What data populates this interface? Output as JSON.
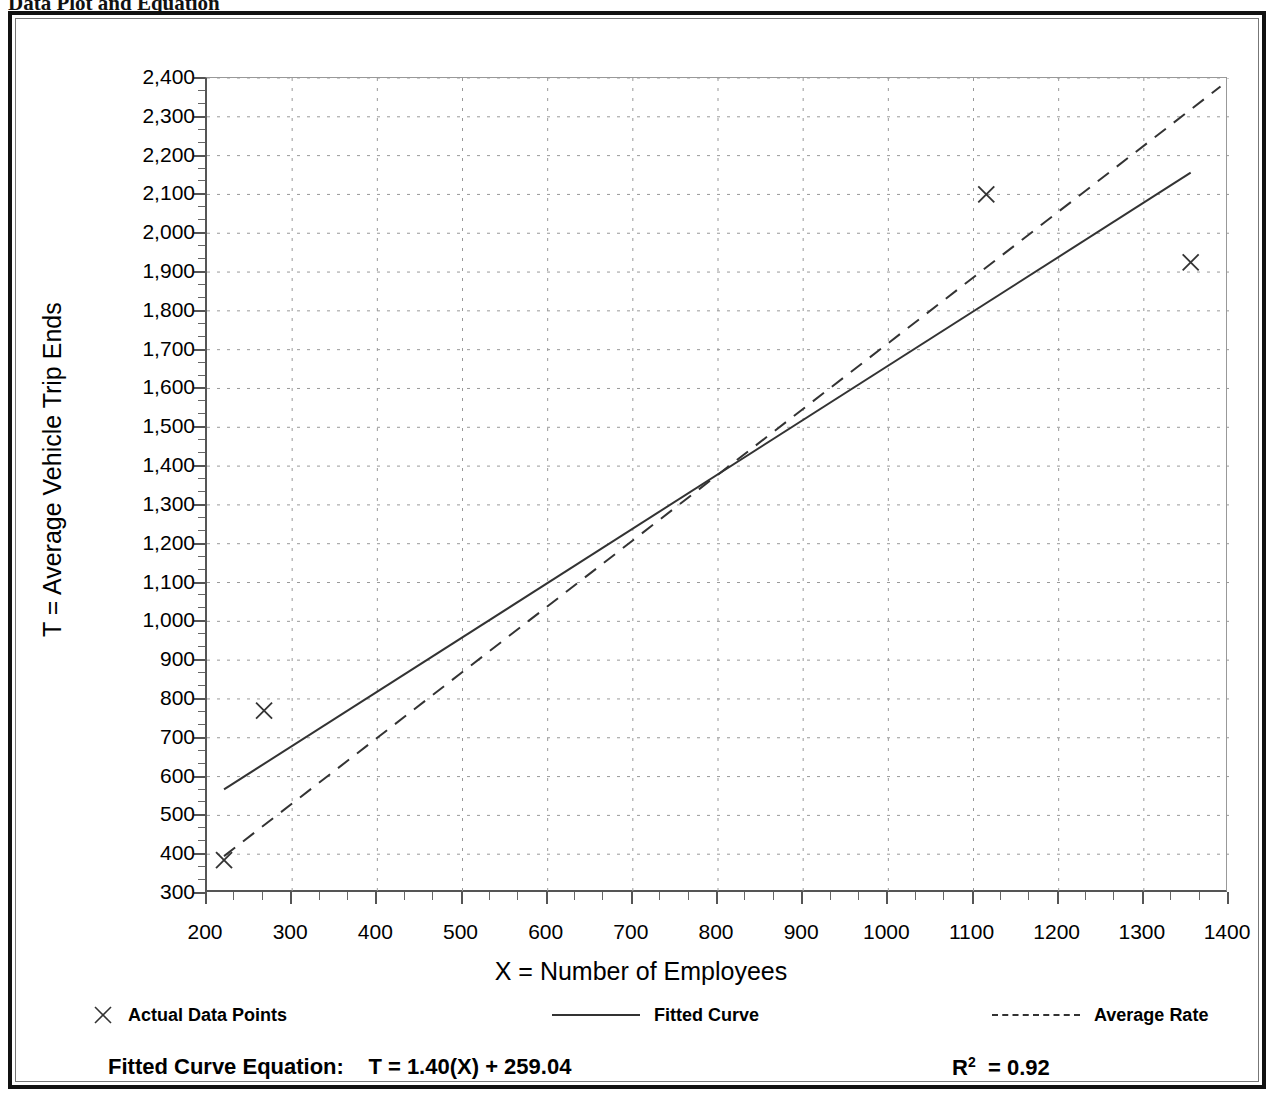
{
  "document": {
    "heading_left": "Data Plot and Equation",
    "heading_right": ""
  },
  "axes": {
    "y_title": "T = Average Vehicle Trip Ends",
    "x_title": "X = Number of Employees"
  },
  "legend": {
    "items": [
      {
        "label": "Actual Data Points",
        "glyph": "x-marker-icon"
      },
      {
        "label": "Fitted Curve",
        "glyph": "solid-line-icon"
      },
      {
        "label": "Average Rate",
        "glyph": "dashed-line-icon"
      }
    ]
  },
  "footer": {
    "equation_label": "Fitted Curve Equation:",
    "equation": "T = 1.40(X) + 259.04",
    "equation_full": "Fitted Curve Equation:  T = 1.40(X) + 259.04",
    "r2_symbol": "R",
    "r2_exponent": "2",
    "r2_value": "= 0.92",
    "r2_full": "R2 = 0.92"
  },
  "colors": {
    "axis": "#555555",
    "grid": "#999999",
    "fitted_curve": "#333333",
    "average_rate": "#333333",
    "marker": "#333333",
    "frame": "#111111"
  },
  "chart_data": {
    "type": "scatter",
    "title": "Data Plot and Equation",
    "xlabel": "X = Number of Employees",
    "ylabel": "T = Average Vehicle Trip Ends",
    "xlim": [
      200,
      1400
    ],
    "ylim": [
      300,
      2400
    ],
    "xticks": [
      200,
      300,
      400,
      500,
      600,
      700,
      800,
      900,
      1000,
      1100,
      1200,
      1300,
      1400
    ],
    "yticks": [
      300,
      400,
      500,
      600,
      700,
      800,
      900,
      1000,
      1100,
      1200,
      1300,
      1400,
      1500,
      1600,
      1700,
      1800,
      1900,
      2000,
      2100,
      2200,
      2300,
      2400
    ],
    "xtick_labels": [
      "200",
      "300",
      "400",
      "500",
      "600",
      "700",
      "800",
      "900",
      "1000",
      "1100",
      "1200",
      "1300",
      "1400"
    ],
    "ytick_labels": [
      "300",
      "400",
      "500",
      "600",
      "700",
      "800",
      "900",
      "1,000",
      "1,100",
      "1,200",
      "1,300",
      "1,400",
      "1,500",
      "1,600",
      "1,700",
      "1,800",
      "1,900",
      "2,000",
      "2,100",
      "2,200",
      "2,300",
      "2,400"
    ],
    "minor_ticks_per_interval": 2,
    "grid": true,
    "grid_style": "dotted",
    "legend_position": "below-plot",
    "series": [
      {
        "name": "Actual Data Points",
        "type": "scatter",
        "marker": "x",
        "points": [
          {
            "x": 220,
            "y": 385
          },
          {
            "x": 267,
            "y": 770
          },
          {
            "x": 1115,
            "y": 2100
          },
          {
            "x": 1355,
            "y": 1925
          }
        ]
      },
      {
        "name": "Fitted Curve",
        "type": "line",
        "style": "solid",
        "equation": "T = 1.40(X) + 259.04",
        "slope": 1.4,
        "intercept": 259.04,
        "endpoints": [
          {
            "x": 220,
            "y": 567
          },
          {
            "x": 1355,
            "y": 2156
          }
        ]
      },
      {
        "name": "Average Rate",
        "type": "line",
        "style": "dashed",
        "endpoints": [
          {
            "x": 220,
            "y": 395
          },
          {
            "x": 1390,
            "y": 2378
          }
        ]
      }
    ],
    "annotations": [
      {
        "text": "Fitted Curve Equation:  T = 1.40(X) + 259.04",
        "position": "footer-left"
      },
      {
        "text": "R2 = 0.92",
        "position": "footer-right"
      }
    ]
  }
}
